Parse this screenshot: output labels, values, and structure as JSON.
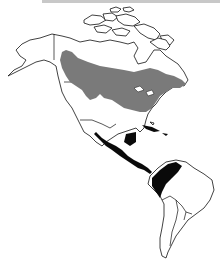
{
  "map": {
    "type": "species range map",
    "region": "North and South America",
    "background": "#ffffff",
    "outline_color": "#111111",
    "top_band_color": "#c8c8c8",
    "ranges": [
      {
        "name": "breeding-range",
        "area": "Southern Canada and northern/eastern United States",
        "color": "#7a7a7a"
      },
      {
        "name": "wintering-range",
        "area": "Southern Mexico, Central America and northwestern South America",
        "color": "#0a0a0a"
      }
    ]
  }
}
